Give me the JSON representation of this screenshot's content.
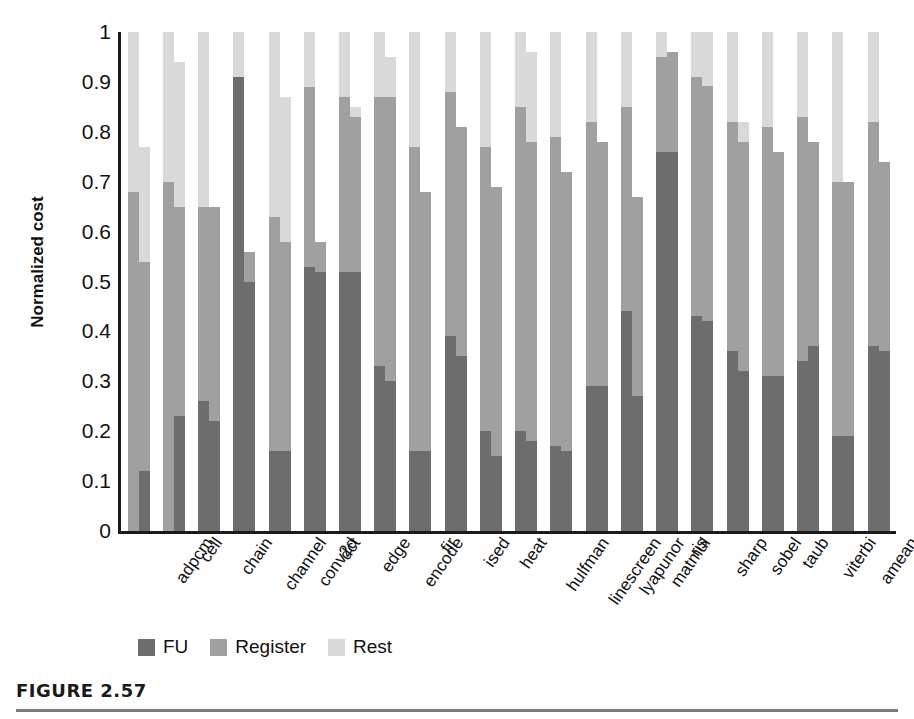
{
  "figure": {
    "caption": "FIGURE 2.57",
    "ylabel": "Normalized cost"
  },
  "legend": {
    "position": "bottom-left",
    "items": [
      {
        "label": "FU",
        "color": "#6d6d6d",
        "swatch_name": "legend-swatch-fu"
      },
      {
        "label": "Register",
        "color": "#a0a0a0",
        "swatch_name": "legend-swatch-register"
      },
      {
        "label": "Rest",
        "color": "#d9d9d9",
        "swatch_name": "legend-swatch-rest"
      }
    ]
  },
  "chart_data": {
    "type": "bar",
    "subtype": "stacked-grouped",
    "title": "",
    "xlabel": "",
    "ylabel": "Normalized cost",
    "ylim": [
      0,
      1
    ],
    "grid": false,
    "yticks": [
      "0",
      "0.1",
      "0.2",
      "0.3",
      "0.4",
      "0.5",
      "0.6",
      "0.7",
      "0.8",
      "0.9",
      "1"
    ],
    "ytick_values": [
      0,
      0.1,
      0.2,
      0.3,
      0.4,
      0.5,
      0.6,
      0.7,
      0.8,
      0.9,
      1.0
    ],
    "legend_entries": [
      "FU",
      "Register",
      "Rest"
    ],
    "colors": {
      "FU": "#6d6d6d",
      "Register": "#a0a0a0",
      "Rest": "#d9d9d9"
    },
    "categories": [
      "adpcm",
      "cell",
      "chain",
      "channel",
      "conv2d",
      "dct",
      "edge",
      "encode",
      "fir",
      "ised",
      "heat",
      "hulfman",
      "linescreen",
      "lyapunor",
      "matmul",
      "ris",
      "sharp",
      "sobel",
      "taub",
      "viterbi",
      "amean"
    ],
    "bars_per_category": 2,
    "groups": [
      {
        "category": "adpcm",
        "bars": [
          {
            "fu": 0.0,
            "register": 0.68,
            "rest": 0.32,
            "total": 1.0
          },
          {
            "fu": 0.12,
            "register": 0.42,
            "rest": 0.23,
            "total": 0.77
          }
        ]
      },
      {
        "category": "cell",
        "bars": [
          {
            "fu": 0.0,
            "register": 0.7,
            "rest": 0.3,
            "total": 1.0
          },
          {
            "fu": 0.23,
            "register": 0.42,
            "rest": 0.29,
            "total": 0.94
          }
        ]
      },
      {
        "category": "chain",
        "bars": [
          {
            "fu": 0.26,
            "register": 0.39,
            "rest": 0.35,
            "total": 1.0
          },
          {
            "fu": 0.22,
            "register": 0.43,
            "rest": 0.0,
            "total": 0.65
          }
        ]
      },
      {
        "category": "channel",
        "bars": [
          {
            "fu": 0.91,
            "register": 0.0,
            "rest": 0.09,
            "total": 1.0
          },
          {
            "fu": 0.5,
            "register": 0.06,
            "rest": 0.0,
            "total": 0.56
          }
        ]
      },
      {
        "category": "conv2d",
        "bars": [
          {
            "fu": 0.16,
            "register": 0.47,
            "rest": 0.37,
            "total": 1.0
          },
          {
            "fu": 0.16,
            "register": 0.42,
            "rest": 0.29,
            "total": 0.87
          }
        ]
      },
      {
        "category": "dct",
        "bars": [
          {
            "fu": 0.53,
            "register": 0.36,
            "rest": 0.11,
            "total": 1.0
          },
          {
            "fu": 0.52,
            "register": 0.06,
            "rest": 0.0,
            "total": 0.58
          }
        ]
      },
      {
        "category": "edge",
        "bars": [
          {
            "fu": 0.52,
            "register": 0.35,
            "rest": 0.13,
            "total": 1.0
          },
          {
            "fu": 0.52,
            "register": 0.31,
            "rest": 0.02,
            "total": 0.85
          }
        ]
      },
      {
        "category": "encode",
        "bars": [
          {
            "fu": 0.33,
            "register": 0.54,
            "rest": 0.13,
            "total": 1.0
          },
          {
            "fu": 0.3,
            "register": 0.57,
            "rest": 0.08,
            "total": 0.95
          }
        ]
      },
      {
        "category": "fir",
        "bars": [
          {
            "fu": 0.16,
            "register": 0.61,
            "rest": 0.23,
            "total": 1.0
          },
          {
            "fu": 0.16,
            "register": 0.52,
            "rest": 0.0,
            "total": 0.68
          }
        ]
      },
      {
        "category": "ised",
        "bars": [
          {
            "fu": 0.39,
            "register": 0.49,
            "rest": 0.12,
            "total": 1.0
          },
          {
            "fu": 0.35,
            "register": 0.46,
            "rest": 0.0,
            "total": 0.81
          }
        ]
      },
      {
        "category": "heat",
        "bars": [
          {
            "fu": 0.2,
            "register": 0.57,
            "rest": 0.23,
            "total": 1.0
          },
          {
            "fu": 0.15,
            "register": 0.54,
            "rest": 0.0,
            "total": 0.69
          }
        ]
      },
      {
        "category": "hulfman",
        "bars": [
          {
            "fu": 0.2,
            "register": 0.65,
            "rest": 0.15,
            "total": 1.0
          },
          {
            "fu": 0.18,
            "register": 0.6,
            "rest": 0.18,
            "total": 0.96
          }
        ]
      },
      {
        "category": "linescreen",
        "bars": [
          {
            "fu": 0.17,
            "register": 0.62,
            "rest": 0.21,
            "total": 1.0
          },
          {
            "fu": 0.16,
            "register": 0.56,
            "rest": 0.0,
            "total": 0.72
          }
        ]
      },
      {
        "category": "lyapunor",
        "bars": [
          {
            "fu": 0.29,
            "register": 0.53,
            "rest": 0.18,
            "total": 1.0
          },
          {
            "fu": 0.29,
            "register": 0.49,
            "rest": 0.0,
            "total": 0.78
          }
        ]
      },
      {
        "category": "matmul",
        "bars": [
          {
            "fu": 0.44,
            "register": 0.41,
            "rest": 0.15,
            "total": 1.0
          },
          {
            "fu": 0.27,
            "register": 0.4,
            "rest": 0.0,
            "total": 0.67
          }
        ]
      },
      {
        "category": "ris",
        "bars": [
          {
            "fu": 0.76,
            "register": 0.19,
            "rest": 0.05,
            "total": 1.0
          },
          {
            "fu": 0.76,
            "register": 0.2,
            "rest": 0.0,
            "total": 0.96
          }
        ]
      },
      {
        "category": "sharp",
        "bars": [
          {
            "fu": 0.43,
            "register": 0.48,
            "rest": 0.09,
            "total": 1.0
          },
          {
            "fu": 0.43,
            "register": 0.48,
            "rest": 0.11,
            "total": 1.02
          }
        ]
      },
      {
        "category": "sobel",
        "bars": [
          {
            "fu": 0.36,
            "register": 0.46,
            "rest": 0.18,
            "total": 1.0
          },
          {
            "fu": 0.32,
            "register": 0.46,
            "rest": 0.04,
            "total": 0.82
          }
        ]
      },
      {
        "category": "taub",
        "bars": [
          {
            "fu": 0.31,
            "register": 0.5,
            "rest": 0.19,
            "total": 1.0
          },
          {
            "fu": 0.31,
            "register": 0.45,
            "rest": 0.0,
            "total": 0.76
          }
        ]
      },
      {
        "category": "viterbi",
        "bars": [
          {
            "fu": 0.34,
            "register": 0.49,
            "rest": 0.17,
            "total": 1.0
          },
          {
            "fu": 0.37,
            "register": 0.41,
            "rest": 0.0,
            "total": 0.78
          }
        ]
      },
      {
        "category": "amean",
        "bars": [
          {
            "fu": 0.19,
            "register": 0.51,
            "rest": 0.3,
            "total": 1.0
          },
          {
            "fu": 0.19,
            "register": 0.51,
            "rest": 0.0,
            "total": 0.7
          }
        ]
      }
    ],
    "extra_groups": [
      {
        "category": "amean-2",
        "bars": [
          {
            "fu": 0.37,
            "register": 0.45,
            "rest": 0.18,
            "total": 1.0
          },
          {
            "fu": 0.36,
            "register": 0.38,
            "rest": 0.0,
            "total": 0.74
          }
        ]
      }
    ]
  }
}
